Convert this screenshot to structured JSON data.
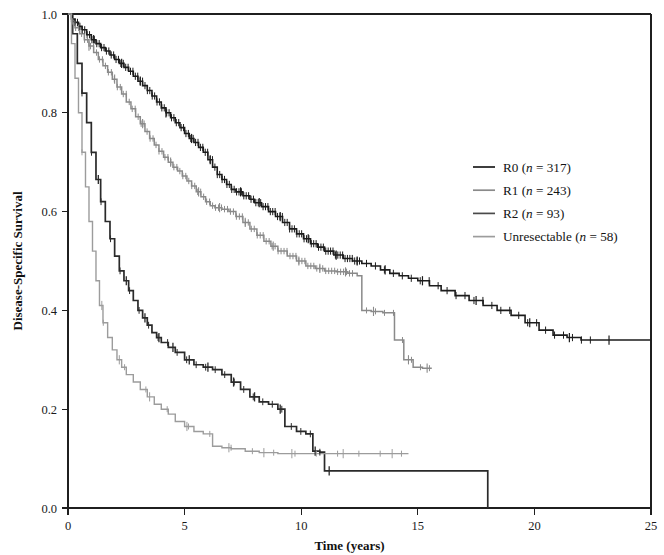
{
  "chart_data": {
    "type": "line",
    "title": "",
    "subtitle": "",
    "xlabel": "Time (years)",
    "ylabel": "Disease-Specific Survival",
    "xlim": [
      0,
      25
    ],
    "ylim": [
      0.0,
      1.0
    ],
    "xticks": [
      0,
      5,
      10,
      15,
      20,
      25
    ],
    "xtick_labels": [
      "0",
      "5",
      "10",
      "15",
      "20",
      "25"
    ],
    "yticks": [
      0.0,
      0.2,
      0.4,
      0.6,
      0.8,
      1.0
    ],
    "ytick_labels": [
      "0.0",
      "0.2",
      "0.4",
      "0.6",
      "0.8",
      "1.0"
    ],
    "grid": false,
    "legend_position": "right-middle",
    "plot_kind": "kaplan-meier-survival",
    "censor_marker": "plus-tick",
    "series": [
      {
        "name": "R0",
        "label": "R0 (n = 317)",
        "n": 317,
        "color": "#1c1c1c",
        "linewidth": 1.6,
        "points": [
          [
            0.0,
            1.0
          ],
          [
            0.15,
            0.99
          ],
          [
            0.3,
            0.983
          ],
          [
            0.45,
            0.975
          ],
          [
            0.6,
            0.968
          ],
          [
            0.8,
            0.958
          ],
          [
            1.0,
            0.948
          ],
          [
            1.2,
            0.94
          ],
          [
            1.4,
            0.932
          ],
          [
            1.6,
            0.925
          ],
          [
            1.8,
            0.917
          ],
          [
            2.0,
            0.908
          ],
          [
            2.2,
            0.9
          ],
          [
            2.4,
            0.892
          ],
          [
            2.6,
            0.884
          ],
          [
            2.8,
            0.874
          ],
          [
            3.0,
            0.864
          ],
          [
            3.2,
            0.855
          ],
          [
            3.4,
            0.845
          ],
          [
            3.6,
            0.834
          ],
          [
            3.8,
            0.822
          ],
          [
            4.0,
            0.81
          ],
          [
            4.2,
            0.8
          ],
          [
            4.4,
            0.79
          ],
          [
            4.6,
            0.78
          ],
          [
            4.8,
            0.77
          ],
          [
            5.0,
            0.758
          ],
          [
            5.2,
            0.748
          ],
          [
            5.4,
            0.74
          ],
          [
            5.6,
            0.73
          ],
          [
            5.8,
            0.72
          ],
          [
            6.0,
            0.705
          ],
          [
            6.2,
            0.69
          ],
          [
            6.4,
            0.675
          ],
          [
            6.6,
            0.665
          ],
          [
            6.8,
            0.655
          ],
          [
            7.0,
            0.645
          ],
          [
            7.2,
            0.64
          ],
          [
            7.5,
            0.632
          ],
          [
            7.8,
            0.625
          ],
          [
            8.0,
            0.618
          ],
          [
            8.3,
            0.61
          ],
          [
            8.6,
            0.6
          ],
          [
            8.9,
            0.59
          ],
          [
            9.2,
            0.578
          ],
          [
            9.5,
            0.565
          ],
          [
            9.8,
            0.555
          ],
          [
            10.1,
            0.545
          ],
          [
            10.4,
            0.535
          ],
          [
            10.7,
            0.528
          ],
          [
            11.0,
            0.52
          ],
          [
            11.4,
            0.512
          ],
          [
            11.8,
            0.505
          ],
          [
            12.2,
            0.5
          ],
          [
            12.6,
            0.495
          ],
          [
            13.0,
            0.49
          ],
          [
            13.4,
            0.482
          ],
          [
            13.8,
            0.475
          ],
          [
            14.2,
            0.47
          ],
          [
            14.6,
            0.465
          ],
          [
            15.0,
            0.46
          ],
          [
            15.5,
            0.45
          ],
          [
            16.0,
            0.44
          ],
          [
            16.6,
            0.43
          ],
          [
            17.2,
            0.42
          ],
          [
            17.8,
            0.41
          ],
          [
            18.4,
            0.4
          ],
          [
            19.0,
            0.39
          ],
          [
            19.6,
            0.375
          ],
          [
            20.2,
            0.36
          ],
          [
            20.8,
            0.35
          ],
          [
            21.4,
            0.345
          ],
          [
            22.0,
            0.34
          ],
          [
            23.0,
            0.34
          ],
          [
            24.0,
            0.34
          ],
          [
            25.0,
            0.34
          ]
        ],
        "plateau_value": 0.34,
        "censor_times": [
          1.1,
          2.3,
          3.1,
          4.2,
          5.3,
          6.1,
          7.4,
          8.2,
          9.1,
          10.3,
          11.5,
          12.4,
          13.6,
          15.2,
          17.5,
          19.8,
          21.5,
          23.2
        ]
      },
      {
        "name": "R1",
        "label": "R1 (n = 243)",
        "n": 243,
        "color": "#8a8a8a",
        "linewidth": 1.5,
        "points": [
          [
            0.0,
            1.0
          ],
          [
            0.15,
            0.985
          ],
          [
            0.3,
            0.972
          ],
          [
            0.5,
            0.96
          ],
          [
            0.7,
            0.948
          ],
          [
            0.9,
            0.935
          ],
          [
            1.1,
            0.922
          ],
          [
            1.3,
            0.908
          ],
          [
            1.5,
            0.895
          ],
          [
            1.7,
            0.882
          ],
          [
            1.9,
            0.868
          ],
          [
            2.1,
            0.852
          ],
          [
            2.3,
            0.838
          ],
          [
            2.5,
            0.822
          ],
          [
            2.7,
            0.808
          ],
          [
            2.9,
            0.792
          ],
          [
            3.1,
            0.778
          ],
          [
            3.3,
            0.762
          ],
          [
            3.5,
            0.748
          ],
          [
            3.7,
            0.735
          ],
          [
            3.9,
            0.722
          ],
          [
            4.1,
            0.71
          ],
          [
            4.3,
            0.7
          ],
          [
            4.5,
            0.69
          ],
          [
            4.7,
            0.682
          ],
          [
            4.9,
            0.672
          ],
          [
            5.1,
            0.662
          ],
          [
            5.3,
            0.652
          ],
          [
            5.5,
            0.64
          ],
          [
            5.7,
            0.63
          ],
          [
            5.9,
            0.62
          ],
          [
            6.1,
            0.612
          ],
          [
            6.3,
            0.608
          ],
          [
            6.6,
            0.605
          ],
          [
            6.9,
            0.6
          ],
          [
            7.2,
            0.59
          ],
          [
            7.5,
            0.578
          ],
          [
            7.8,
            0.565
          ],
          [
            8.1,
            0.552
          ],
          [
            8.4,
            0.54
          ],
          [
            8.7,
            0.53
          ],
          [
            9.0,
            0.52
          ],
          [
            9.4,
            0.51
          ],
          [
            9.8,
            0.5
          ],
          [
            10.2,
            0.49
          ],
          [
            10.6,
            0.485
          ],
          [
            11.0,
            0.48
          ],
          [
            11.5,
            0.478
          ],
          [
            12.0,
            0.475
          ],
          [
            12.4,
            0.47
          ],
          [
            12.6,
            0.4
          ],
          [
            13.0,
            0.398
          ],
          [
            13.5,
            0.395
          ],
          [
            14.0,
            0.34
          ],
          [
            14.4,
            0.3
          ],
          [
            14.8,
            0.285
          ],
          [
            15.2,
            0.283
          ],
          [
            15.6,
            0.283
          ]
        ],
        "plateau_value": 0.283,
        "censor_times": [
          0.9,
          2.0,
          3.2,
          4.4,
          5.6,
          6.5,
          7.6,
          8.8,
          9.9,
          10.8,
          11.9,
          13.1,
          14.6,
          15.4
        ]
      },
      {
        "name": "R2",
        "label": "R2 (n = 93)",
        "n": 93,
        "color": "#2a2a2a",
        "linewidth": 1.7,
        "points": [
          [
            0.0,
            1.0
          ],
          [
            0.2,
            0.96
          ],
          [
            0.4,
            0.9
          ],
          [
            0.6,
            0.84
          ],
          [
            0.8,
            0.78
          ],
          [
            1.0,
            0.72
          ],
          [
            1.2,
            0.665
          ],
          [
            1.4,
            0.62
          ],
          [
            1.6,
            0.58
          ],
          [
            1.8,
            0.545
          ],
          [
            2.0,
            0.51
          ],
          [
            2.2,
            0.48
          ],
          [
            2.4,
            0.46
          ],
          [
            2.6,
            0.44
          ],
          [
            2.8,
            0.42
          ],
          [
            3.0,
            0.4
          ],
          [
            3.2,
            0.385
          ],
          [
            3.4,
            0.37
          ],
          [
            3.6,
            0.355
          ],
          [
            3.8,
            0.345
          ],
          [
            4.0,
            0.335
          ],
          [
            4.3,
            0.325
          ],
          [
            4.6,
            0.315
          ],
          [
            5.0,
            0.3
          ],
          [
            5.4,
            0.29
          ],
          [
            5.8,
            0.285
          ],
          [
            6.2,
            0.28
          ],
          [
            6.6,
            0.27
          ],
          [
            7.0,
            0.255
          ],
          [
            7.4,
            0.24
          ],
          [
            7.8,
            0.225
          ],
          [
            8.2,
            0.215
          ],
          [
            8.6,
            0.21
          ],
          [
            9.0,
            0.2
          ],
          [
            9.3,
            0.165
          ],
          [
            9.8,
            0.155
          ],
          [
            10.2,
            0.15
          ],
          [
            10.5,
            0.115
          ],
          [
            10.8,
            0.113
          ],
          [
            11.0,
            0.075
          ],
          [
            12.0,
            0.075
          ],
          [
            14.0,
            0.075
          ],
          [
            16.0,
            0.075
          ],
          [
            17.9,
            0.075
          ],
          [
            18.0,
            0.0
          ]
        ],
        "final_drop_time": 18.0,
        "censor_times": [
          1.3,
          2.5,
          3.3,
          3.9,
          4.5,
          5.2,
          6.0,
          7.1,
          8.0,
          9.1,
          10.6,
          11.2
        ]
      },
      {
        "name": "Unresectable",
        "label": "Unresectable (n = 58)",
        "n": 58,
        "color": "#9c9c9c",
        "linewidth": 1.4,
        "points": [
          [
            0.0,
            1.0
          ],
          [
            0.15,
            0.94
          ],
          [
            0.3,
            0.87
          ],
          [
            0.45,
            0.8
          ],
          [
            0.6,
            0.72
          ],
          [
            0.75,
            0.65
          ],
          [
            0.9,
            0.58
          ],
          [
            1.05,
            0.52
          ],
          [
            1.2,
            0.46
          ],
          [
            1.35,
            0.41
          ],
          [
            1.5,
            0.375
          ],
          [
            1.7,
            0.345
          ],
          [
            1.9,
            0.32
          ],
          [
            2.1,
            0.3
          ],
          [
            2.3,
            0.285
          ],
          [
            2.5,
            0.27
          ],
          [
            2.8,
            0.255
          ],
          [
            3.1,
            0.24
          ],
          [
            3.4,
            0.225
          ],
          [
            3.7,
            0.21
          ],
          [
            4.0,
            0.2
          ],
          [
            4.3,
            0.19
          ],
          [
            4.6,
            0.175
          ],
          [
            5.0,
            0.165
          ],
          [
            5.4,
            0.155
          ],
          [
            5.8,
            0.15
          ],
          [
            6.2,
            0.125
          ],
          [
            6.6,
            0.122
          ],
          [
            7.0,
            0.12
          ],
          [
            7.6,
            0.115
          ],
          [
            8.2,
            0.112
          ],
          [
            9.0,
            0.11
          ],
          [
            10.0,
            0.11
          ],
          [
            11.0,
            0.11
          ],
          [
            12.0,
            0.11
          ],
          [
            13.0,
            0.11
          ],
          [
            14.0,
            0.11
          ],
          [
            14.6,
            0.11
          ]
        ],
        "plateau_value": 0.11,
        "censor_times": [
          1.45,
          2.2,
          3.5,
          5.1,
          6.9,
          8.4,
          9.6,
          11.8,
          13.9
        ]
      }
    ]
  },
  "legend": {
    "entries": [
      {
        "label_main": "R0",
        "label_n": "(n = 317)",
        "color": "#1c1c1c"
      },
      {
        "label_main": "R1",
        "label_n": "(n = 243)",
        "color": "#8a8a8a"
      },
      {
        "label_main": "R2",
        "label_n": "(n = 93)",
        "color": "#4a4a4a"
      },
      {
        "label_main": "Unresectable",
        "label_n": "(n = 58)",
        "color": "#9c9c9c"
      }
    ]
  },
  "axes": {
    "x_title": "Time (years)",
    "y_title": "Disease-Specific Survival"
  }
}
